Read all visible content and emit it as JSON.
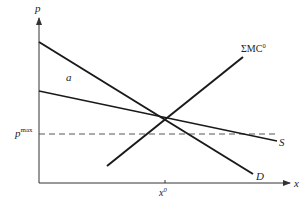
{
  "diagram": {
    "type": "supply-demand-price-ceiling",
    "axes": {
      "y_label": "p",
      "x_label": "x"
    },
    "curves": {
      "demand": {
        "label": "D",
        "from": [
          39,
          42
        ],
        "to": [
          253,
          174
        ]
      },
      "supply": {
        "label": "S",
        "from": [
          39,
          91
        ],
        "to": [
          277,
          141
        ]
      },
      "marginal_cost": {
        "label_main": "ΣMC",
        "label_sup": "0",
        "from": [
          107,
          166
        ],
        "to": [
          243,
          57
        ]
      }
    },
    "price_ceiling": {
      "label_main": "p",
      "label_sup": "max",
      "y": 134
    },
    "equilibrium_quantity": {
      "label_main": "x",
      "label_sup": "0",
      "x": 165
    },
    "region_label": "a",
    "colors": {
      "line": "#1a1a1a",
      "axis": "#333333",
      "dashed": "#444444",
      "background": "#ffffff"
    }
  }
}
